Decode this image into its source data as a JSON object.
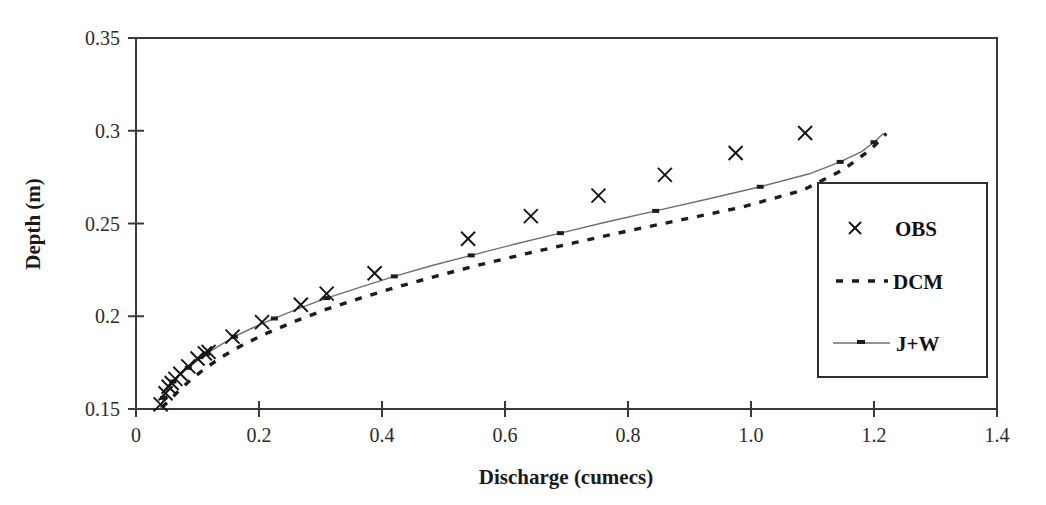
{
  "chart_data": {
    "type": "scatter",
    "title": "",
    "xlabel": "Discharge (cumecs)",
    "ylabel": "Depth (m)",
    "xlim": [
      0,
      1.4
    ],
    "ylim": [
      0.15,
      0.35
    ],
    "xticks": [
      0,
      0.2,
      0.4,
      0.6,
      0.8,
      1.0,
      1.2,
      1.4
    ],
    "xtick_labels": [
      "0",
      "0.2",
      "0.4",
      "0.6",
      "0.8",
      "1.0",
      "1.2",
      "1.4"
    ],
    "yticks": [
      0.15,
      0.2,
      0.25,
      0.3,
      0.35
    ],
    "ytick_labels": [
      "0.15",
      "0.2",
      "0.25",
      "0.3",
      "0.35"
    ],
    "grid": false,
    "legend_position": "right",
    "series": [
      {
        "name": "OBS",
        "style": "markers",
        "marker": "x",
        "color": "#141414",
        "points": [
          [
            0.04,
            0.1525
          ],
          [
            0.048,
            0.1585
          ],
          [
            0.053,
            0.162
          ],
          [
            0.058,
            0.164
          ],
          [
            0.064,
            0.1662
          ],
          [
            0.072,
            0.169
          ],
          [
            0.085,
            0.173
          ],
          [
            0.1,
            0.1772
          ],
          [
            0.112,
            0.18
          ],
          [
            0.118,
            0.1808
          ],
          [
            0.157,
            0.189
          ],
          [
            0.205,
            0.1968
          ],
          [
            0.268,
            0.2062
          ],
          [
            0.31,
            0.2122
          ],
          [
            0.388,
            0.2232
          ],
          [
            0.54,
            0.2418
          ],
          [
            0.642,
            0.254
          ],
          [
            0.752,
            0.265
          ],
          [
            0.86,
            0.2762
          ],
          [
            0.975,
            0.288
          ],
          [
            1.088,
            0.2988
          ]
        ]
      },
      {
        "name": "DCM",
        "style": "dashed-line",
        "color": "#1d1d1d",
        "points": [
          [
            0.042,
            0.1508
          ],
          [
            0.055,
            0.1548
          ],
          [
            0.07,
            0.16
          ],
          [
            0.09,
            0.166
          ],
          [
            0.112,
            0.1718
          ],
          [
            0.14,
            0.1782
          ],
          [
            0.175,
            0.1848
          ],
          [
            0.215,
            0.1912
          ],
          [
            0.26,
            0.1975
          ],
          [
            0.31,
            0.2038
          ],
          [
            0.365,
            0.2098
          ],
          [
            0.425,
            0.2158
          ],
          [
            0.49,
            0.2218
          ],
          [
            0.56,
            0.2278
          ],
          [
            0.635,
            0.2338
          ],
          [
            0.715,
            0.2398
          ],
          [
            0.8,
            0.246
          ],
          [
            0.89,
            0.2522
          ],
          [
            0.985,
            0.2588
          ],
          [
            1.085,
            0.268
          ],
          [
            1.15,
            0.279
          ],
          [
            1.195,
            0.29
          ],
          [
            1.22,
            0.2985
          ]
        ]
      },
      {
        "name": "J+W",
        "style": "line-with-markers",
        "color": "#6f6f6f",
        "points": [
          [
            0.04,
            0.1505
          ],
          [
            0.045,
            0.156
          ],
          [
            0.052,
            0.1612
          ],
          [
            0.06,
            0.1648
          ],
          [
            0.07,
            0.1682
          ],
          [
            0.085,
            0.1722
          ],
          [
            0.1,
            0.1762
          ],
          [
            0.115,
            0.1798
          ],
          [
            0.135,
            0.184
          ],
          [
            0.16,
            0.189
          ],
          [
            0.19,
            0.1938
          ],
          [
            0.225,
            0.1988
          ],
          [
            0.265,
            0.2042
          ],
          [
            0.31,
            0.2098
          ],
          [
            0.36,
            0.2152
          ],
          [
            0.42,
            0.2215
          ],
          [
            0.48,
            0.2272
          ],
          [
            0.545,
            0.2328
          ],
          [
            0.615,
            0.2388
          ],
          [
            0.69,
            0.2448
          ],
          [
            0.765,
            0.2508
          ],
          [
            0.845,
            0.2568
          ],
          [
            0.93,
            0.2632
          ],
          [
            1.015,
            0.2698
          ],
          [
            1.095,
            0.2768
          ],
          [
            1.145,
            0.2832
          ],
          [
            1.18,
            0.2888
          ],
          [
            1.2,
            0.2938
          ],
          [
            1.215,
            0.2985
          ]
        ]
      }
    ],
    "legend_entries": [
      {
        "label": "OBS",
        "style": "marker-x"
      },
      {
        "label": "DCM",
        "style": "dashed"
      },
      {
        "label": "J+W",
        "style": "solid-marker"
      }
    ]
  }
}
